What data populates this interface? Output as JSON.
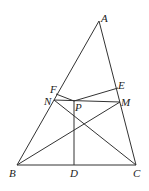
{
  "figure": {
    "labels": {
      "A": "A",
      "B": "B",
      "C": "C",
      "D": "D",
      "E": "E",
      "F": "F",
      "M": "M",
      "N": "N",
      "P": "P"
    },
    "points": {
      "A": [
        99,
        21
      ],
      "B": [
        17,
        165
      ],
      "C": [
        136,
        165
      ],
      "D": [
        74,
        165
      ],
      "F": [
        56,
        93
      ],
      "N": [
        54,
        100
      ],
      "E": [
        118,
        88
      ],
      "M": [
        120,
        102
      ],
      "P": [
        74,
        100
      ]
    },
    "segments": [
      [
        "A",
        "B"
      ],
      [
        "A",
        "C"
      ],
      [
        "B",
        "C"
      ],
      [
        "B",
        "M"
      ],
      [
        "N",
        "C"
      ],
      [
        "N",
        "M"
      ],
      [
        "P",
        "D"
      ],
      [
        "P",
        "F"
      ],
      [
        "P",
        "E"
      ]
    ]
  }
}
